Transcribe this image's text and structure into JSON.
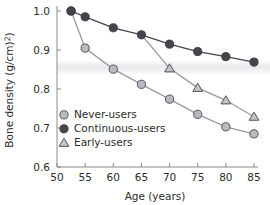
{
  "chart_data": {
    "type": "line",
    "title": "",
    "xlabel": "Age (years)",
    "ylabel": "Bone density (g/cm²)",
    "xlim": [
      50,
      85
    ],
    "ylim": [
      0.6,
      1.0
    ],
    "xticks": [
      50,
      55,
      60,
      65,
      70,
      75,
      80,
      85
    ],
    "xtick_labels": [
      "50",
      "55",
      "60",
      "65",
      "70",
      "75",
      "80",
      "85"
    ],
    "yticks": [
      0.6,
      0.7,
      0.8,
      0.9,
      1.0
    ],
    "ytick_labels": [
      "0.6",
      "0.7",
      "0.8",
      "0.9",
      "1.0"
    ],
    "grid": false,
    "legend_position": "lower-left-inside",
    "reference_band": {
      "y_min": 0.838,
      "y_max": 0.872,
      "color": "#e9e9ec"
    },
    "series": [
      {
        "name": "Never-users",
        "marker": "circle",
        "color": "#9a9aa2",
        "marker_fill": "#b9b9c0",
        "x": [
          52.5,
          55,
          60,
          65,
          70,
          75,
          80,
          85
        ],
        "values": [
          1.0,
          0.905,
          0.851,
          0.812,
          0.774,
          0.735,
          0.703,
          0.685
        ]
      },
      {
        "name": "Continuous-users",
        "marker": "circle-filled",
        "color": "#45454d",
        "marker_fill": "#45454d",
        "x": [
          52.5,
          55,
          60,
          65,
          70,
          75,
          80,
          85
        ],
        "values": [
          1.0,
          0.985,
          0.957,
          0.939,
          0.915,
          0.896,
          0.883,
          0.869
        ]
      },
      {
        "name": "Early-users",
        "marker": "triangle",
        "color": "#9a9aa2",
        "marker_fill": "#c3c3ca",
        "x": [
          65,
          70,
          75,
          80,
          85
        ],
        "values": [
          0.939,
          0.853,
          0.803,
          0.771,
          0.729
        ]
      }
    ]
  },
  "legend": {
    "items": [
      {
        "label": "Never-users",
        "marker": "circle"
      },
      {
        "label": "Continuous-users",
        "marker": "circle-filled"
      },
      {
        "label": "Early-users",
        "marker": "triangle"
      }
    ]
  }
}
